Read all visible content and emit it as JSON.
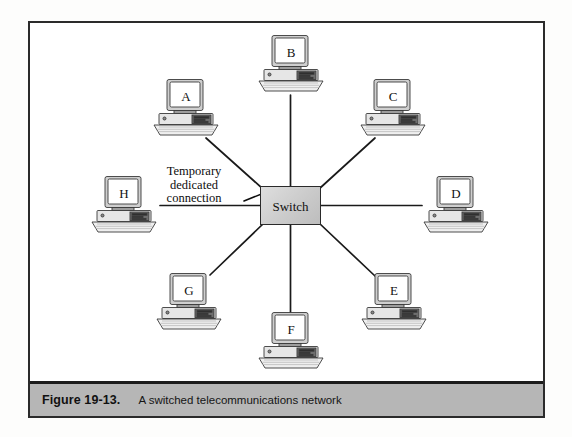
{
  "figure": {
    "caption_label": "Figure 19-13.",
    "caption_text": "A switched telecommunications network"
  },
  "diagram": {
    "type": "star-network-topology",
    "center": {
      "label": "Switch",
      "shape": "rectangle",
      "fill_color": "#cccccc",
      "border_color": "#2a2a2a"
    },
    "annotation": {
      "line1": "Temporary",
      "line2": "dedicated",
      "line3": "connection",
      "points_to": "Switch"
    },
    "nodes": [
      {
        "label": "A",
        "icon": "desktop-computer-icon",
        "position": "upper-left"
      },
      {
        "label": "B",
        "icon": "desktop-computer-icon",
        "position": "top"
      },
      {
        "label": "C",
        "icon": "desktop-computer-icon",
        "position": "upper-right"
      },
      {
        "label": "D",
        "icon": "desktop-computer-icon",
        "position": "right"
      },
      {
        "label": "E",
        "icon": "desktop-computer-icon",
        "position": "lower-right"
      },
      {
        "label": "F",
        "icon": "desktop-computer-icon",
        "position": "bottom"
      },
      {
        "label": "G",
        "icon": "desktop-computer-icon",
        "position": "lower-left"
      },
      {
        "label": "H",
        "icon": "desktop-computer-icon",
        "position": "left"
      }
    ],
    "connections": [
      {
        "from": "A",
        "to": "Switch"
      },
      {
        "from": "B",
        "to": "Switch"
      },
      {
        "from": "C",
        "to": "Switch"
      },
      {
        "from": "D",
        "to": "Switch"
      },
      {
        "from": "E",
        "to": "Switch"
      },
      {
        "from": "F",
        "to": "Switch"
      },
      {
        "from": "G",
        "to": "Switch"
      },
      {
        "from": "H",
        "to": "Switch"
      }
    ]
  },
  "colors": {
    "frame_border": "#2b2b2b",
    "caption_bar": "#b6b6b6",
    "line": "#1a1a1a",
    "page_background": "#fdfdfc"
  }
}
